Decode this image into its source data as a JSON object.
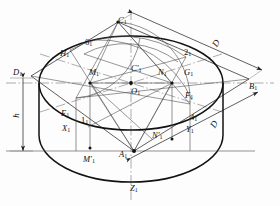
{
  "figure": {
    "background_color": "#fdfdfd",
    "line_color": "#1a1a1a",
    "thin_line_color": "#555555",
    "width": 280,
    "height": 206
  },
  "dimensions": [
    {
      "name": "diameter-upper",
      "label": "D",
      "x": 213,
      "y": 39,
      "rotate": -58
    },
    {
      "name": "diameter-lower",
      "label": "D",
      "x": 211,
      "y": 120,
      "rotate": -58
    },
    {
      "name": "height",
      "label": "h",
      "x": 14,
      "y": 111,
      "rotate": -90
    }
  ],
  "vertices": [
    {
      "name": "apex-top",
      "label": "C",
      "sub": "1",
      "prime": "",
      "x": 118,
      "y": 16
    },
    {
      "name": "vertex-left",
      "label": "D",
      "sub": "1",
      "prime": "",
      "x": 13,
      "y": 68
    },
    {
      "name": "vertex-right",
      "label": "B",
      "sub": "1",
      "prime": "",
      "x": 249,
      "y": 82
    },
    {
      "name": "vertex-bottom",
      "label": "A",
      "sub": "1",
      "prime": "",
      "x": 119,
      "y": 150
    }
  ],
  "points": [
    {
      "name": "point-H1",
      "label": "H",
      "sub": "1",
      "prime": "",
      "x": 60,
      "y": 49
    },
    {
      "name": "point-6-1",
      "label": "6",
      "sub": "1",
      "prime": "",
      "x": 85,
      "y": 38,
      "numeric": true
    },
    {
      "name": "point-2-1",
      "label": "2",
      "sub": "1",
      "prime": "",
      "x": 184,
      "y": 48,
      "numeric": true
    },
    {
      "name": "point-M1",
      "label": "M",
      "sub": "1",
      "prime": "",
      "x": 89,
      "y": 68
    },
    {
      "name": "point-C1-prime",
      "label": "C",
      "sub": "1",
      "prime": "′",
      "x": 131,
      "y": 64
    },
    {
      "name": "point-N1",
      "label": "N",
      "sub": "1",
      "prime": "",
      "x": 158,
      "y": 68
    },
    {
      "name": "point-G1",
      "label": "G",
      "sub": "1",
      "prime": "",
      "x": 184,
      "y": 68
    },
    {
      "name": "point-O1",
      "label": "O",
      "sub": "1",
      "prime": "",
      "x": 131,
      "y": 87
    },
    {
      "name": "point-F1",
      "label": "F",
      "sub": "1",
      "prime": "",
      "x": 185,
      "y": 91
    },
    {
      "name": "point-E1",
      "label": "E",
      "sub": "1",
      "prime": "",
      "x": 61,
      "y": 109
    },
    {
      "name": "point-1-1",
      "label": "1",
      "sub": "1",
      "prime": "",
      "x": 81,
      "y": 116,
      "numeric": true
    },
    {
      "name": "point-4-1",
      "label": "4",
      "sub": "1",
      "prime": "",
      "x": 190,
      "y": 113,
      "numeric": true
    },
    {
      "name": "point-X1",
      "label": "X",
      "sub": "1",
      "prime": "",
      "x": 62,
      "y": 124
    },
    {
      "name": "point-Y1",
      "label": "Y",
      "sub": "1",
      "prime": "",
      "x": 186,
      "y": 125
    },
    {
      "name": "point-N1-prime",
      "label": "N",
      "sub": "1",
      "prime": "′",
      "x": 152,
      "y": 131
    },
    {
      "name": "point-M1-prime",
      "label": "M",
      "sub": "1",
      "prime": "′",
      "x": 83,
      "y": 155
    },
    {
      "name": "point-Z1",
      "label": "Z",
      "sub": "1",
      "prime": "",
      "x": 130,
      "y": 184
    }
  ]
}
